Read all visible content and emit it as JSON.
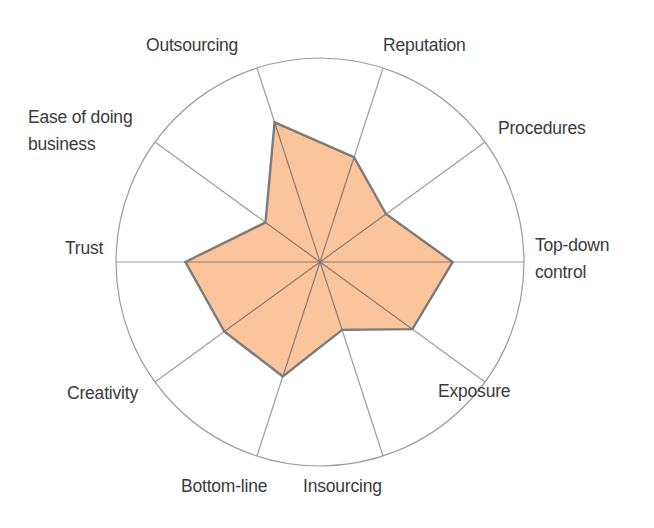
{
  "chart_data": {
    "type": "radar",
    "title": "",
    "center": [
      320,
      262
    ],
    "radius": 204,
    "range": [
      0,
      1
    ],
    "grid": {
      "outer_circle": true,
      "spokes": true
    },
    "colors": {
      "fill": "#fbc49b",
      "outline": "#7b7b7b",
      "grid": "#9c9c9c",
      "text": "#3b3b3b",
      "background": "#ffffff"
    },
    "axes": [
      {
        "key": "top_down_control",
        "label_lines": [
          "Top-down",
          "control"
        ],
        "angle_deg": 0,
        "value": 0.65,
        "label_pos": [
          535,
          232
        ],
        "align": "left"
      },
      {
        "key": "procedures",
        "label_lines": [
          "Procedures"
        ],
        "angle_deg": 36,
        "value": 0.4,
        "label_pos": [
          498,
          115
        ],
        "align": "left"
      },
      {
        "key": "reputation",
        "label_lines": [
          "Reputation"
        ],
        "angle_deg": 72,
        "value": 0.54,
        "label_pos": [
          383,
          32
        ],
        "align": "left"
      },
      {
        "key": "outsourcing",
        "label_lines": [
          "Outsourcing"
        ],
        "angle_deg": 108,
        "value": 0.72,
        "label_pos": [
          146,
          32
        ],
        "align": "left"
      },
      {
        "key": "ease_of_doing_business",
        "label_lines": [
          "Ease of doing",
          "business"
        ],
        "angle_deg": 144,
        "value": 0.33,
        "label_pos": [
          28,
          104
        ],
        "align": "left"
      },
      {
        "key": "trust",
        "label_lines": [
          "Trust"
        ],
        "angle_deg": 180,
        "value": 0.66,
        "label_pos": [
          65,
          235
        ],
        "align": "left"
      },
      {
        "key": "creativity",
        "label_lines": [
          "Creativity"
        ],
        "angle_deg": 216,
        "value": 0.58,
        "label_pos": [
          67,
          380
        ],
        "align": "left"
      },
      {
        "key": "bottom_line",
        "label_lines": [
          "Bottom-line"
        ],
        "angle_deg": 252,
        "value": 0.59,
        "label_pos": [
          181,
          473
        ],
        "align": "left"
      },
      {
        "key": "insourcing",
        "label_lines": [
          "Insourcing"
        ],
        "angle_deg": 288,
        "value": 0.35,
        "label_pos": [
          303,
          473
        ],
        "align": "left"
      },
      {
        "key": "exposure",
        "label_lines": [
          "Exposure"
        ],
        "angle_deg": 324,
        "value": 0.56,
        "label_pos": [
          438,
          378
        ],
        "align": "left"
      }
    ],
    "categories": [
      "Top-down control",
      "Procedures",
      "Reputation",
      "Outsourcing",
      "Ease of doing business",
      "Trust",
      "Creativity",
      "Bottom-line",
      "Insourcing",
      "Exposure"
    ],
    "series": [
      {
        "name": "profile",
        "values": [
          0.65,
          0.4,
          0.54,
          0.72,
          0.33,
          0.66,
          0.58,
          0.59,
          0.35,
          0.56
        ]
      }
    ],
    "legend": null,
    "xlabel": "",
    "ylabel": ""
  }
}
